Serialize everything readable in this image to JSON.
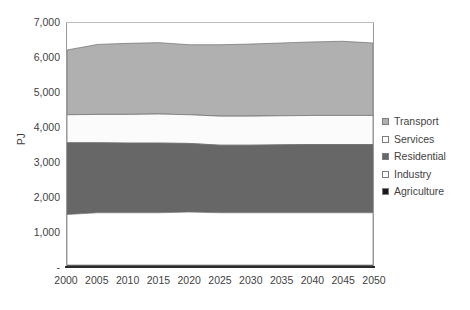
{
  "chart_data": {
    "type": "area",
    "stacked": true,
    "title": "",
    "xlabel": "",
    "ylabel": "PJ",
    "x": [
      2000,
      2005,
      2010,
      2015,
      2020,
      2025,
      2030,
      2035,
      2040,
      2045,
      2050
    ],
    "xtick_labels": [
      "2000",
      "2005",
      "2010",
      "2015",
      "2020",
      "2025",
      "2030",
      "2035",
      "2040",
      "2045",
      "2050"
    ],
    "xlim": [
      2000,
      2050
    ],
    "ylim": [
      0,
      7000
    ],
    "ytick_values": [
      0,
      1000,
      2000,
      3000,
      4000,
      5000,
      6000,
      7000
    ],
    "ytick_labels": [
      "-",
      "1,000",
      "2,000",
      "3,000",
      "4,000",
      "5,000",
      "6,000",
      "7,000"
    ],
    "grid": false,
    "legend_position": "right",
    "stack_order_bottom_to_top": [
      "Agriculture",
      "Industry",
      "Residential",
      "Services",
      "Transport"
    ],
    "series": [
      {
        "name": "Agriculture",
        "color": "#1a1a1a",
        "values": [
          50,
          50,
          50,
          50,
          50,
          50,
          50,
          50,
          50,
          50,
          50
        ]
      },
      {
        "name": "Industry",
        "color": "#ffffff",
        "values": [
          1450,
          1500,
          1500,
          1500,
          1520,
          1500,
          1500,
          1500,
          1500,
          1500,
          1500
        ]
      },
      {
        "name": "Residential",
        "color": "#676767",
        "values": [
          2050,
          2000,
          1990,
          1990,
          1960,
          1930,
          1930,
          1940,
          1950,
          1950,
          1950
        ]
      },
      {
        "name": "Services",
        "color": "#fbfbfb",
        "values": [
          800,
          810,
          820,
          830,
          820,
          830,
          830,
          830,
          830,
          830,
          830
        ]
      },
      {
        "name": "Transport",
        "color": "#b0b0b0",
        "values": [
          1850,
          2000,
          2030,
          2040,
          2000,
          2040,
          2060,
          2080,
          2100,
          2120,
          2070
        ]
      }
    ],
    "cumulative_tops": {
      "Agriculture": [
        50,
        50,
        50,
        50,
        50,
        50,
        50,
        50,
        50,
        50,
        50
      ],
      "Industry": [
        1500,
        1550,
        1550,
        1550,
        1570,
        1550,
        1550,
        1550,
        1550,
        1550,
        1550
      ],
      "Residential": [
        3550,
        3550,
        3540,
        3540,
        3530,
        3480,
        3480,
        3490,
        3500,
        3500,
        3500
      ],
      "Services": [
        4350,
        4360,
        4360,
        4370,
        4350,
        4310,
        4310,
        4320,
        4330,
        4330,
        4330
      ],
      "Transport": [
        6200,
        6360,
        6390,
        6410,
        6350,
        6350,
        6370,
        6400,
        6430,
        6450,
        6400
      ]
    },
    "totals": [
      6200,
      6360,
      6390,
      6410,
      6350,
      6350,
      6370,
      6400,
      6430,
      6450,
      6400
    ]
  },
  "legend": {
    "items": [
      {
        "label": "Transport",
        "color": "#b0b0b0"
      },
      {
        "label": "Services",
        "color": "#ffffff"
      },
      {
        "label": "Residential",
        "color": "#676767"
      },
      {
        "label": "Industry",
        "color": "#ffffff"
      },
      {
        "label": "Agriculture",
        "color": "#1a1a1a"
      }
    ]
  },
  "colors": {
    "axis": "#2b2b2b",
    "frame": "#9a9a9a",
    "text": "#3f3f3f",
    "band_outline": "#6e6e6e",
    "background": "#ffffff"
  }
}
